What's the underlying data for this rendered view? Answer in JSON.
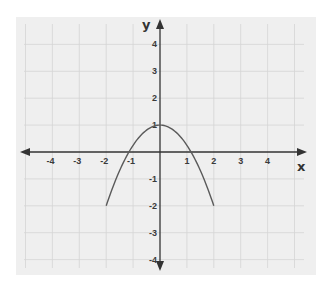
{
  "chart_data": {
    "type": "line",
    "title": "",
    "xlabel": "x",
    "ylabel": "y",
    "xlim": [
      -5,
      5
    ],
    "ylim": [
      -4,
      4
    ],
    "grid": true,
    "legend": null,
    "x_ticks": [
      -4,
      -3,
      -2,
      -1,
      1,
      2,
      3,
      4
    ],
    "y_ticks": [
      4,
      3,
      2,
      1,
      -1,
      -2,
      -3,
      -4
    ],
    "x_tick_labels": [
      "-4",
      "-3",
      "-2",
      "-1",
      "1",
      "2",
      "3",
      "4"
    ],
    "y_tick_labels": [
      "4",
      "3",
      "2",
      "1",
      "-1",
      "-2",
      "-3",
      "-4"
    ],
    "series": [
      {
        "name": "parabola",
        "description": "downward-opening parabola, vertex (0,1), endpoints (-2,-2) and (2,-2)",
        "x": [
          -2,
          -1.5,
          -1,
          -0.5,
          0,
          0.5,
          1,
          1.5,
          2
        ],
        "y": [
          -2,
          -0.69,
          0.25,
          0.81,
          1,
          0.81,
          0.25,
          -0.69,
          -2
        ]
      }
    ],
    "annotations": []
  },
  "colors": {
    "paper": "#efefef",
    "grid": "#d4d4d4",
    "axis": "#333333",
    "curve": "#5a5a5a"
  }
}
